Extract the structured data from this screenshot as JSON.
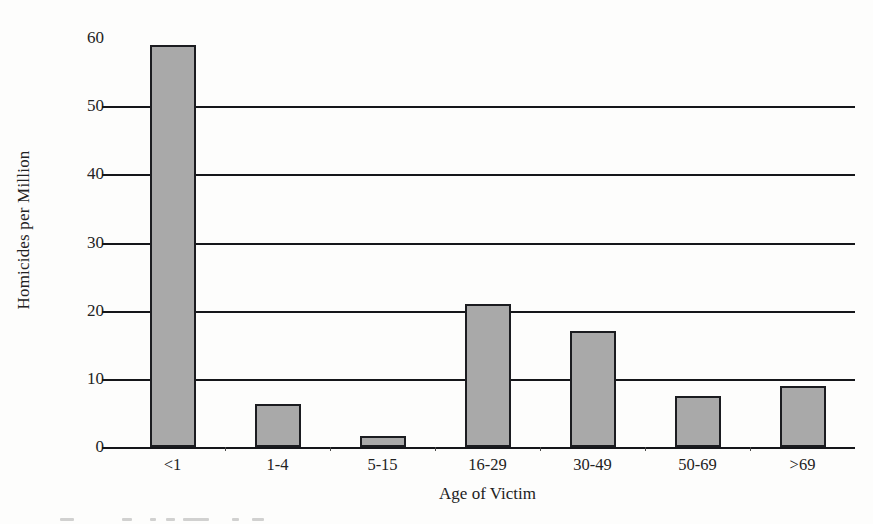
{
  "chart_data": {
    "type": "bar",
    "title": "",
    "xlabel": "Age of Victim",
    "ylabel": "Homicides per Million",
    "categories": [
      "<1",
      "1-4",
      "5-15",
      "16-29",
      "30-49",
      "50-69",
      ">69"
    ],
    "values": [
      59,
      6.3,
      1.6,
      21,
      17,
      7.5,
      9
    ],
    "ylim": [
      0,
      60
    ],
    "yticks": [
      0,
      10,
      20,
      30,
      40,
      50,
      60
    ],
    "ytick_labels": [
      "0",
      "10",
      "20",
      "30",
      "40",
      "50",
      "60"
    ],
    "gridlines": [
      10,
      20,
      30,
      40,
      50
    ],
    "grid": true,
    "legend": false,
    "legend_position": "none",
    "bar_color": "#a9a9a9",
    "bar_border_color": "#1b1c20",
    "axis_color": "#15161a",
    "background": "#fdfdfc"
  }
}
